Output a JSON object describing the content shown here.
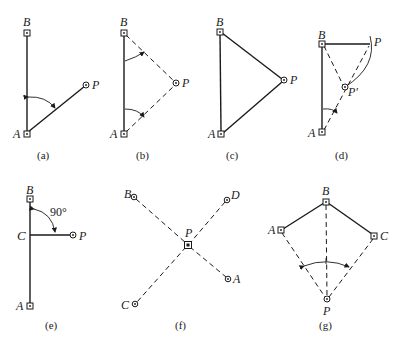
{
  "figure": {
    "panels": [
      {
        "id": "a",
        "caption": "(a)",
        "points": {
          "B": "B",
          "A": "A",
          "P": "P"
        }
      },
      {
        "id": "b",
        "caption": "(b)",
        "points": {
          "B": "B",
          "A": "A",
          "P": "P"
        }
      },
      {
        "id": "c",
        "caption": "(c)",
        "points": {
          "B": "B",
          "A": "A",
          "P": "P"
        }
      },
      {
        "id": "d",
        "caption": "(d)",
        "points": {
          "B": "B",
          "A": "A",
          "P": "P",
          "P2": "P'"
        }
      },
      {
        "id": "e",
        "caption": "(e)",
        "angle": "90°",
        "points": {
          "B": "B",
          "C": "C",
          "P": "P",
          "A": "A"
        }
      },
      {
        "id": "f",
        "caption": "(f)",
        "points": {
          "B": "B",
          "D": "D",
          "P": "P",
          "A": "A",
          "C": "C"
        }
      },
      {
        "id": "g",
        "caption": "(g)",
        "points": {
          "B": "B",
          "A": "A",
          "C": "C",
          "P": "P"
        }
      }
    ]
  },
  "colors": {
    "ink": "#1a1a1a",
    "background": "#ffffff"
  }
}
